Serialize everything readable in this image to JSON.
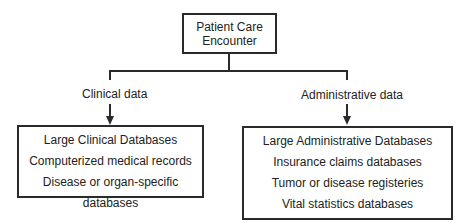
{
  "root": {
    "line1": "Patient Care",
    "line2": "Encounter"
  },
  "branches": [
    {
      "label": "Clinical data",
      "box_items": [
        "Large Clinical Databases",
        "Computerized medical records",
        "Disease or organ-specific databases"
      ]
    },
    {
      "label": "Administrative data",
      "box_items": [
        "Large Administrative Databases",
        "Insurance claims databases",
        "Tumor or disease registeries",
        "Vital statistics databases"
      ]
    }
  ]
}
